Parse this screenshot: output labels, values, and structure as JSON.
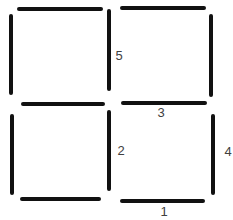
{
  "diagram": {
    "type": "matchstick-puzzle",
    "stick_color": "#111111",
    "label_color": "#404040",
    "sticks": [
      {
        "id": "tl-top",
        "x1": 19,
        "y1": 9,
        "x2": 101,
        "y2": 9,
        "label": ""
      },
      {
        "id": "tl-left",
        "x1": 11,
        "y1": 16,
        "x2": 11,
        "y2": 93,
        "label": ""
      },
      {
        "id": "tl-right",
        "x1": 109,
        "y1": 11,
        "x2": 109,
        "y2": 89,
        "label": "5"
      },
      {
        "id": "tl-bottom",
        "x1": 23,
        "y1": 104,
        "x2": 103,
        "y2": 104,
        "label": ""
      },
      {
        "id": "tr-top",
        "x1": 122,
        "y1": 8,
        "x2": 204,
        "y2": 8,
        "label": ""
      },
      {
        "id": "tr-right",
        "x1": 211,
        "y1": 16,
        "x2": 211,
        "y2": 95,
        "label": ""
      },
      {
        "id": "tr-bottom",
        "x1": 123,
        "y1": 103,
        "x2": 205,
        "y2": 103,
        "label": "3"
      },
      {
        "id": "bl-left",
        "x1": 12,
        "y1": 116,
        "x2": 12,
        "y2": 193,
        "label": ""
      },
      {
        "id": "bl-right",
        "x1": 109,
        "y1": 112,
        "x2": 109,
        "y2": 189,
        "label": "2"
      },
      {
        "id": "bl-bottom",
        "x1": 22,
        "y1": 199,
        "x2": 99,
        "y2": 199,
        "label": ""
      },
      {
        "id": "br-right",
        "x1": 213,
        "y1": 116,
        "x2": 213,
        "y2": 193,
        "label": "4"
      },
      {
        "id": "br-bottom",
        "x1": 122,
        "y1": 201,
        "x2": 203,
        "y2": 201,
        "label": "1"
      }
    ],
    "labels": [
      {
        "text": "5",
        "x": 119,
        "y": 56
      },
      {
        "text": "3",
        "x": 161,
        "y": 114
      },
      {
        "text": "2",
        "x": 121,
        "y": 151
      },
      {
        "text": "4",
        "x": 228,
        "y": 153
      },
      {
        "text": "1",
        "x": 164,
        "y": 213
      }
    ]
  }
}
